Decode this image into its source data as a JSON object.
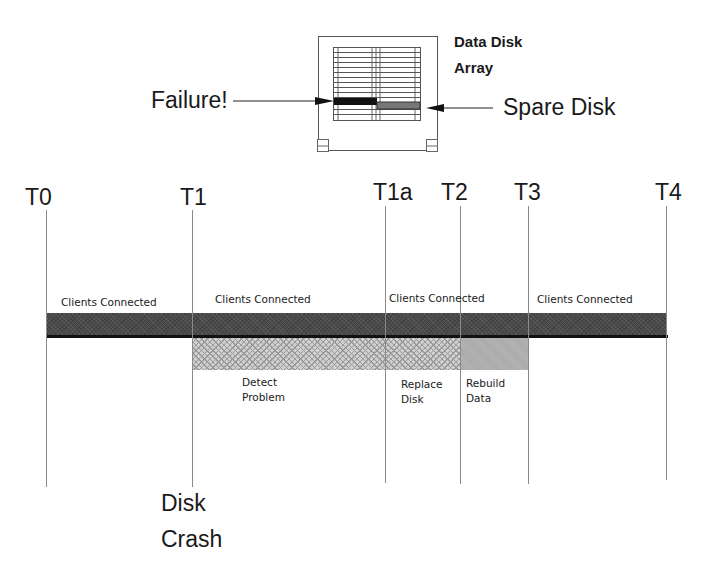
{
  "diagram": {
    "array_label_line1": "Data Disk",
    "array_label_line2": "Array",
    "failure_label": "Failure!",
    "spare_label": "Spare Disk",
    "timepoints": [
      {
        "label": "T0",
        "x": 46
      },
      {
        "label": "T1",
        "x": 192
      },
      {
        "label": "T1a",
        "x": 385
      },
      {
        "label": "T2",
        "x": 460
      },
      {
        "label": "T3",
        "x": 528
      },
      {
        "label": "T4",
        "x": 666
      }
    ],
    "segments_top": [
      {
        "label": "Clients Connected"
      },
      {
        "label": "Clients Connected"
      },
      {
        "label": "Clients Connected"
      },
      {
        "label": "Clients Connected"
      }
    ],
    "phases": [
      {
        "line1": "Detect",
        "line2": "Problem"
      },
      {
        "line1": "Replace",
        "line2": "Disk"
      },
      {
        "line1": "Rebuild",
        "line2": "Data"
      }
    ],
    "event_line1": "Disk",
    "event_line2": "Crash",
    "colors": {
      "main_bar": "#4a4a4a",
      "detect_bar": "#cfcfcf",
      "rebuild_bar": "#b4b4b4",
      "line": "#111111"
    }
  }
}
